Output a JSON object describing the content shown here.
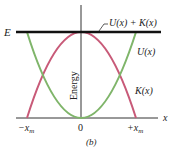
{
  "diagram": {
    "caption": "(b)",
    "y_axis_label": "Energy",
    "x_axis_label": "x",
    "energy_level_label": "E",
    "x_ticks": [
      "-x_m",
      "0",
      "+x_m"
    ],
    "x_tick_text": {
      "neg": "−x",
      "neg_sub": "m",
      "zero": "0",
      "pos": "+x",
      "pos_sub": "m"
    },
    "curves": [
      {
        "name": "U(x)",
        "label": "U(x)",
        "shape": "upward parabola",
        "color": "#7fb56a"
      },
      {
        "name": "K(x)",
        "label": "K(x)",
        "shape": "downward parabola",
        "color": "#c85a78"
      },
      {
        "name": "U(x) + K(x)",
        "label": "U(x) + K(x)",
        "shape": "horizontal line at E",
        "color": "#111111"
      }
    ],
    "colors": {
      "potential": "#7fb56a",
      "kinetic": "#c85a78",
      "total": "#111111",
      "axes": "#333333"
    }
  }
}
